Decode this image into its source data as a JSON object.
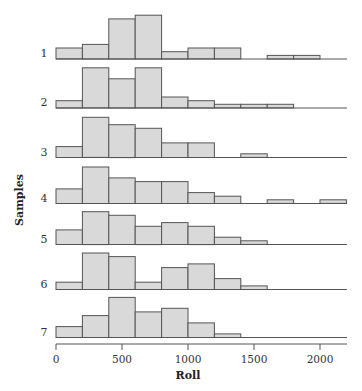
{
  "chart_data": {
    "type": "bar",
    "subtype": "stacked-small-multiples-histogram",
    "title": "",
    "xlabel": "Roll",
    "ylabel": "Samples",
    "xlim": [
      0,
      2200
    ],
    "x_ticks": [
      0,
      500,
      1000,
      1500,
      2000
    ],
    "bin_width": 200,
    "bin_edges": [
      0,
      200,
      400,
      600,
      800,
      1000,
      1200,
      1400,
      1600,
      1800,
      2000,
      2200
    ],
    "grid": false,
    "legend": null,
    "series": [
      {
        "name": "1",
        "values": [
          3,
          4,
          11,
          12,
          2,
          3,
          3,
          0,
          1,
          1,
          0
        ]
      },
      {
        "name": "2",
        "values": [
          2,
          11,
          8,
          11,
          3,
          2,
          1,
          1,
          1,
          0,
          0
        ]
      },
      {
        "name": "3",
        "values": [
          3,
          11,
          9,
          8,
          4,
          4,
          0,
          1,
          0,
          0,
          0
        ]
      },
      {
        "name": "4",
        "values": [
          4,
          10,
          7,
          6,
          6,
          3,
          2,
          0,
          1,
          0,
          1
        ]
      },
      {
        "name": "5",
        "values": [
          4,
          9,
          8,
          5,
          6,
          5,
          2,
          1,
          0,
          0,
          0
        ]
      },
      {
        "name": "6",
        "values": [
          2,
          10,
          9,
          2,
          6,
          7,
          3,
          1,
          0,
          0,
          0
        ]
      },
      {
        "name": "7",
        "values": [
          3,
          6,
          11,
          7,
          8,
          4,
          1,
          0,
          0,
          0,
          0
        ]
      }
    ]
  },
  "labels": {
    "xlabel": "Roll",
    "ylabel": "Samples",
    "x_ticks": [
      "0",
      "500",
      "1000",
      "1500",
      "2000"
    ],
    "rows": [
      "1",
      "2",
      "3",
      "4",
      "5",
      "6",
      "7"
    ]
  }
}
